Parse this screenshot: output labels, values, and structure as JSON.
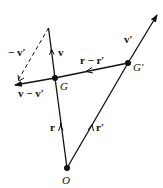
{
  "diagram": {
    "points": {
      "O": {
        "label": "O",
        "x": 67,
        "y": 168
      },
      "G": {
        "label": "G",
        "x": 55,
        "y": 78
      },
      "G_prime": {
        "label": "G′",
        "x": 128,
        "y": 63
      }
    },
    "vectors": {
      "r": {
        "label": "r"
      },
      "r_prime": {
        "label": "r′"
      },
      "v": {
        "label": "v"
      },
      "v_prime": {
        "label": "v′"
      },
      "r_minus_r_prime": {
        "label": "r − r′"
      },
      "v_minus_v_prime": {
        "label": "v − v′"
      },
      "neg_v_prime": {
        "label": "− v′"
      }
    },
    "colors": {
      "stroke": "#111111",
      "background": "#ffffff"
    }
  }
}
